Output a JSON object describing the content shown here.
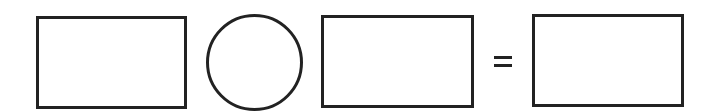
{
  "diagram": {
    "stroke_color": "#222222",
    "background_color": "#ffffff",
    "elements": [
      {
        "type": "rectangle",
        "role": "operand-1",
        "label": "",
        "x": 36,
        "y": 16,
        "width": 151,
        "height": 93
      },
      {
        "type": "circle",
        "role": "operator",
        "label": "",
        "cx": 254,
        "cy": 62,
        "r": 48
      },
      {
        "type": "rectangle",
        "role": "operand-2",
        "label": "",
        "x": 321,
        "y": 15,
        "width": 153,
        "height": 93
      },
      {
        "type": "symbol",
        "role": "equals",
        "label": "=",
        "x": 494,
        "y": 56
      },
      {
        "type": "rectangle",
        "role": "result",
        "label": "",
        "x": 532,
        "y": 14,
        "width": 152,
        "height": 93
      }
    ]
  }
}
